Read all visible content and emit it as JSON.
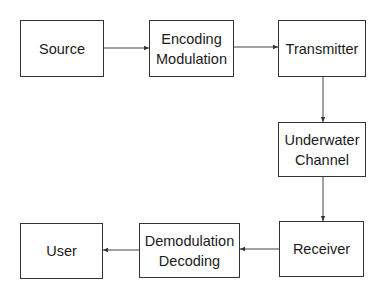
{
  "diagram": {
    "nodes": [
      {
        "id": "source",
        "lines": [
          "Source"
        ]
      },
      {
        "id": "encoding_modulation",
        "lines": [
          "Encoding",
          "Modulation"
        ]
      },
      {
        "id": "transmitter",
        "lines": [
          "Transmitter"
        ]
      },
      {
        "id": "underwater_channel",
        "lines": [
          "Underwater",
          "Channel"
        ]
      },
      {
        "id": "receiver",
        "lines": [
          "Receiver"
        ]
      },
      {
        "id": "demodulation_decoding",
        "lines": [
          "Demodulation",
          "Decoding"
        ]
      },
      {
        "id": "user",
        "lines": [
          "User"
        ]
      }
    ],
    "edges": [
      {
        "from": "source",
        "to": "encoding_modulation"
      },
      {
        "from": "encoding_modulation",
        "to": "transmitter"
      },
      {
        "from": "transmitter",
        "to": "underwater_channel"
      },
      {
        "from": "underwater_channel",
        "to": "receiver"
      },
      {
        "from": "receiver",
        "to": "demodulation_decoding"
      },
      {
        "from": "demodulation_decoding",
        "to": "user"
      }
    ],
    "colors": {
      "stroke": "#333333",
      "text": "#1a1a1a",
      "background": "#ffffff"
    }
  }
}
